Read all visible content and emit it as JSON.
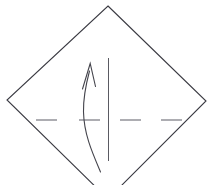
{
  "figure": {
    "name": "rotated-square-with-curved-arrow",
    "width": 214,
    "height": 185,
    "background_color": "#ffffff",
    "stroke_color": "#3a3a42",
    "centerline_color": "#6b6b73"
  },
  "shapes": {
    "diamond": {
      "label": "rotated-square-outline",
      "points": "108,6 206,101 108,199 7,100",
      "stroke_color": "#3a3a42",
      "stroke_width": 1.1,
      "fill": "none"
    },
    "vertical_axis": {
      "label": "vertical-axis-line",
      "x1": 108.5,
      "y1": 58,
      "x2": 108.5,
      "y2": 161,
      "stroke_color": "#5a5a62",
      "stroke_width": 1.0
    },
    "curved_arrow": {
      "label": "upward-curved-arrow",
      "path": "M 100.5 172 C 92 152 84 134 83.5 112 C 83.2 99 85.5 86 89.5 71",
      "stroke_color": "#44444c",
      "stroke_width": 1.1,
      "fill": "none",
      "direction": "up"
    },
    "arrow_head": {
      "label": "arrow-head-tip",
      "path": "M 82.5 89 L 90.2 63.5 L 95.5 86.5",
      "stroke_color": "#44444c",
      "stroke_width": 1.1,
      "fill": "none",
      "tip_x": 90.2,
      "tip_y": 63.5
    },
    "centerline_dashes": [
      {
        "label": "centerline-dash-1",
        "x1": 36,
        "y1": 120,
        "x2": 57,
        "y2": 120
      },
      {
        "label": "centerline-dash-2",
        "x1": 79,
        "y1": 120,
        "x2": 100,
        "y2": 120
      },
      {
        "label": "centerline-dash-3",
        "x1": 120,
        "y1": 120,
        "x2": 141,
        "y2": 120
      },
      {
        "label": "centerline-dash-4",
        "x1": 161,
        "y1": 120,
        "x2": 182,
        "y2": 120
      }
    ]
  },
  "centerline": {
    "stroke_color": "#6b6b73",
    "stroke_width": 1.1,
    "y": 120
  }
}
